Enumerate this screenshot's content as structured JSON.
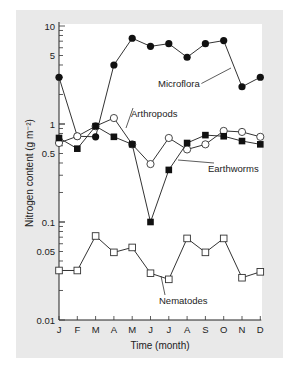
{
  "chart_data": {
    "type": "line",
    "title": "",
    "xlabel": "Time (month)",
    "ylabel": "Nitrogen content (g m⁻²)",
    "yscale": "log",
    "ylim": [
      0.01,
      10
    ],
    "yticks": [
      {
        "value": 10,
        "label": "10"
      },
      {
        "value": 5,
        "label": "5"
      },
      {
        "value": 1,
        "label": "1"
      },
      {
        "value": 0.5,
        "label": "0.5"
      },
      {
        "value": 0.1,
        "label": "0.1"
      },
      {
        "value": 0.05,
        "label": "0.05"
      },
      {
        "value": 0.01,
        "label": "0.01"
      }
    ],
    "categories": [
      "J",
      "F",
      "M",
      "A",
      "M",
      "J",
      "J",
      "A",
      "S",
      "O",
      "N",
      "D"
    ],
    "grid": false,
    "legend": "inline labels",
    "series": [
      {
        "name": "Microflora",
        "marker": "filled-circle",
        "values": [
          3.0,
          0.75,
          0.74,
          4.0,
          7.5,
          6.2,
          6.6,
          4.8,
          6.6,
          7.1,
          2.4,
          3.0
        ]
      },
      {
        "name": "Arthropods",
        "marker": "open-circle",
        "values": [
          0.64,
          0.75,
          0.95,
          1.15,
          0.62,
          0.39,
          0.72,
          0.55,
          0.62,
          0.85,
          0.83,
          0.74
        ]
      },
      {
        "name": "Earthworms",
        "marker": "filled-square",
        "values": [
          0.72,
          0.56,
          0.95,
          0.74,
          0.62,
          0.1,
          0.34,
          0.64,
          0.77,
          0.75,
          0.67,
          0.62
        ]
      },
      {
        "name": "Nematodes",
        "marker": "open-square",
        "values": [
          0.032,
          0.032,
          0.072,
          0.049,
          0.055,
          0.03,
          0.026,
          0.068,
          0.049,
          0.068,
          0.027,
          0.031
        ]
      }
    ],
    "annotations": [
      {
        "text": "Microflora",
        "x": 158,
        "y": 87,
        "leader_to": [
          231,
          68
        ]
      },
      {
        "text": "Arthropods",
        "x": 131,
        "y": 117,
        "leader_to": [
          126,
          128
        ]
      },
      {
        "text": "Earthworms",
        "x": 208,
        "y": 172,
        "leader_to": [
          178,
          160
        ]
      },
      {
        "text": "Nematodes",
        "x": 159,
        "y": 304,
        "leader_to": [
          161,
          276
        ]
      }
    ]
  }
}
